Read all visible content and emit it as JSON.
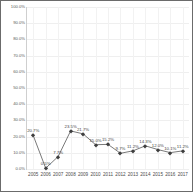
{
  "chart_data": {
    "type": "line",
    "title": "",
    "xlabel": "",
    "ylabel": "",
    "ylim": [
      0,
      100
    ],
    "grid": true,
    "legend": false,
    "categories": [
      "2005",
      "2006",
      "2007",
      "2008",
      "2009",
      "2010",
      "2011",
      "2012",
      "2013",
      "2014",
      "2015",
      "2016",
      "2017"
    ],
    "values": [
      20.7,
      0.5,
      7.7,
      23.5,
      21.7,
      15.0,
      15.2,
      9.7,
      11.2,
      14.3,
      12.0,
      10.1,
      11.2
    ],
    "point_labels": [
      "20.7%",
      "0.5%",
      "7.7%",
      "23.5%",
      "21.7%",
      "15.0%",
      "15.2%",
      "9.7%",
      "11.2%",
      "14.3%",
      "12.0%",
      "10.1%",
      "11.2%"
    ],
    "ytick_labels": [
      "100.0%",
      "90.0%",
      "80.0%",
      "70.0%",
      "60.0%",
      "50.0%",
      "40.0%",
      "30.0%",
      "20.0%",
      "10.0%",
      "0.0%"
    ],
    "ytick_values": [
      100,
      90,
      80,
      70,
      60,
      50,
      40,
      30,
      20,
      10,
      0
    ],
    "series_color": "#3f3f3f",
    "grid_color": "#efefef",
    "axis_color": "#cfcfcf",
    "text_color": "#4a4a4a",
    "background_color": "#ffffff",
    "border_color": "#6b6b6b"
  }
}
